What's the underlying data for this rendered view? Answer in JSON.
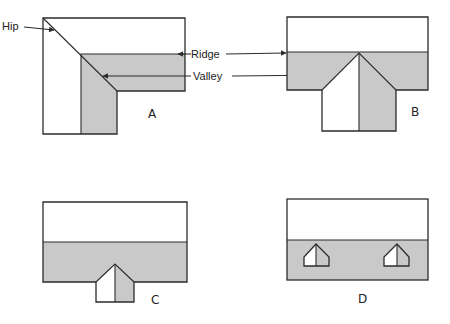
{
  "figure": {
    "panels": [
      {
        "id": "A",
        "label": "A",
        "shape": "L-shaped hipped roof"
      },
      {
        "id": "B",
        "label": "B",
        "shape": "T-shaped roof with hipped projection"
      },
      {
        "id": "C",
        "label": "C",
        "shape": "Rectangular roof with small hipped projection"
      },
      {
        "id": "D",
        "label": "D",
        "shape": "Rectangular roof with two dormers"
      }
    ],
    "annotations": {
      "hip": "Hip",
      "ridge": "Ridge",
      "valley": "Valley"
    },
    "colors": {
      "line": "#2b2b2b",
      "shade": "#c9c9c9",
      "background": "#ffffff"
    }
  }
}
